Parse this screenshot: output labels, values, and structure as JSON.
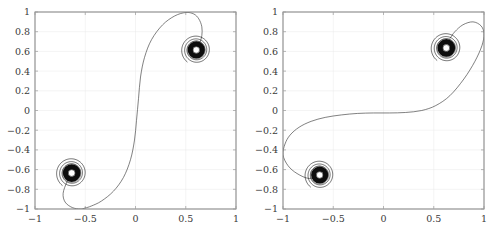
{
  "figure": {
    "title": "",
    "background_color": "#ffffff",
    "panel_count": 2
  },
  "chart_data": [
    {
      "type": "line",
      "panel": "left",
      "title": "",
      "xlabel": "",
      "ylabel": "",
      "xlim": [
        -1,
        1
      ],
      "ylim": [
        -1,
        1
      ],
      "xticks": [
        -1,
        -0.5,
        0,
        0.5,
        1
      ],
      "xticklabels": [
        "-1",
        "-0.5",
        "0",
        "0.5",
        "1"
      ],
      "yticks": [
        -1,
        -0.8,
        -0.6,
        -0.4,
        -0.2,
        0,
        0.2,
        0.4,
        0.6,
        0.8,
        1
      ],
      "yticklabels": [
        "-1",
        "-0.8",
        "-0.6",
        "-0.4",
        "-0.2",
        "0",
        "0.2",
        "0.4",
        "0.6",
        "0.8",
        "1"
      ],
      "grid": true,
      "legend": "none",
      "line_color": "#3d3d3d",
      "series": [
        {
          "name": "trajectory",
          "description": "vertical S-shaped trajectory connecting two spiral attractors",
          "x": [
            -0.63,
            -0.68,
            -0.72,
            -0.7,
            -0.63,
            -0.55,
            -0.5,
            -0.44,
            -0.34,
            -0.22,
            -0.12,
            -0.05,
            -0.01,
            0.01,
            0.03,
            0.05,
            0.09,
            0.16,
            0.27,
            0.39,
            0.5,
            0.58,
            0.63,
            0.66,
            0.66,
            0.64,
            0.61
          ],
          "y": [
            -0.63,
            -0.72,
            -0.84,
            -0.93,
            -0.985,
            -1.0,
            -0.99,
            -0.97,
            -0.92,
            -0.82,
            -0.68,
            -0.5,
            -0.3,
            -0.1,
            0.12,
            0.34,
            0.54,
            0.72,
            0.87,
            0.96,
            0.995,
            0.98,
            0.93,
            0.85,
            0.76,
            0.69,
            0.64
          ]
        }
      ],
      "spirals": [
        {
          "name": "lower-left-spiral",
          "center_x": -0.635,
          "center_y": -0.635,
          "outer_radius": 0.155,
          "turns": 9
        },
        {
          "name": "upper-right-spiral",
          "center_x": 0.605,
          "center_y": 0.615,
          "outer_radius": 0.15,
          "turns": 9
        }
      ]
    },
    {
      "type": "line",
      "panel": "right",
      "title": "",
      "xlabel": "",
      "ylabel": "",
      "xlim": [
        -1,
        1
      ],
      "ylim": [
        -1,
        1
      ],
      "xticks": [
        -1,
        -0.5,
        0,
        0.5,
        1
      ],
      "xticklabels": [
        "-1",
        "-0.5",
        "0",
        "0.5",
        "1"
      ],
      "yticks": [
        -1,
        -0.8,
        -0.6,
        -0.4,
        -0.2,
        0,
        0.2,
        0.4,
        0.6,
        0.8,
        1
      ],
      "yticklabels": [
        "-1",
        "-0.8",
        "-0.6",
        "-0.4",
        "-0.2",
        "0",
        "0.2",
        "0.4",
        "0.6",
        "0.8",
        "1"
      ],
      "grid": true,
      "legend": "none",
      "line_color": "#3d3d3d",
      "series": [
        {
          "name": "trajectory",
          "description": "horizontal S-shaped trajectory connecting two spiral attractors",
          "x": [
            -0.63,
            -0.74,
            -0.86,
            -0.95,
            -1.0,
            -0.98,
            -0.93,
            -0.84,
            -0.72,
            -0.58,
            -0.42,
            -0.26,
            -0.1,
            0.06,
            0.22,
            0.38,
            0.52,
            0.66,
            0.8,
            0.91,
            0.98,
            1.0,
            0.97,
            0.89,
            0.79,
            0.71,
            0.66
          ],
          "y": [
            -0.655,
            -0.69,
            -0.64,
            -0.56,
            -0.45,
            -0.34,
            -0.25,
            -0.17,
            -0.11,
            -0.07,
            -0.045,
            -0.03,
            -0.025,
            -0.025,
            -0.02,
            0.0,
            0.05,
            0.15,
            0.32,
            0.5,
            0.66,
            0.78,
            0.86,
            0.9,
            0.87,
            0.8,
            0.73
          ]
        }
      ],
      "spirals": [
        {
          "name": "lower-left-spiral",
          "center_x": -0.635,
          "center_y": -0.655,
          "outer_radius": 0.15,
          "turns": 9
        },
        {
          "name": "upper-right-spiral",
          "center_x": 0.625,
          "center_y": 0.635,
          "outer_radius": 0.155,
          "turns": 9
        }
      ]
    }
  ]
}
